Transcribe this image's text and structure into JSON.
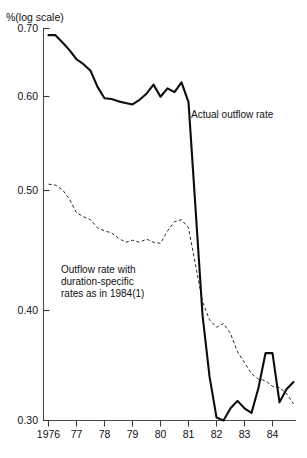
{
  "figure": {
    "yaxis_unit_label": "%(log scale)",
    "background_color": "#ffffff",
    "line_color_solid": "#0d0d0d",
    "line_color_dashed": "#2a2a2a",
    "axis_color": "#4a4a4a"
  },
  "annotations": {
    "actual": "Actual outflow rate",
    "counterfactual_line1": "Outflow rate with",
    "counterfactual_line2": "duration-specific",
    "counterfactual_line3": "rates as in 1984(1)"
  },
  "ticks": {
    "y": [
      "0.70",
      "0.60",
      "0.50",
      "0.40",
      "0.30"
    ],
    "x": [
      "1976",
      "77",
      "78",
      "79",
      "80",
      "81",
      "82",
      "83",
      "84"
    ]
  },
  "chart_data": {
    "type": "line",
    "title": "",
    "subtitle": "",
    "xlabel": "",
    "ylabel": "%(log scale)",
    "yscale": "log",
    "grid": false,
    "legend": "inline-annotations",
    "xlim": [
      1976.0,
      1985.0
    ],
    "ylim": [
      0.3,
      0.7
    ],
    "ytick_values": [
      0.7,
      0.6,
      0.5,
      0.4,
      0.3
    ],
    "ytick_labels": [
      "0.70",
      "0.60",
      "0.50",
      "0.40",
      "0.30"
    ],
    "xtick_values": [
      1976,
      1977,
      1978,
      1979,
      1980,
      1981,
      1982,
      1983,
      1984
    ],
    "xtick_labels": [
      "1976",
      "77",
      "78",
      "79",
      "80",
      "81",
      "82",
      "83",
      "84"
    ],
    "series": [
      {
        "name": "Actual outflow rate",
        "style": "solid",
        "x": [
          1976.0,
          1976.25,
          1976.5,
          1976.75,
          1977.0,
          1977.25,
          1977.5,
          1977.75,
          1978.0,
          1978.25,
          1978.5,
          1978.75,
          1979.0,
          1979.25,
          1979.5,
          1979.75,
          1980.0,
          1980.25,
          1980.5,
          1980.75,
          1981.0,
          1981.25,
          1981.5,
          1981.75,
          1982.0,
          1982.25,
          1982.5,
          1982.75,
          1983.0,
          1983.25,
          1983.5,
          1983.75,
          1984.0,
          1984.25,
          1984.5,
          1984.75
        ],
        "values": [
          0.69,
          0.69,
          0.679,
          0.668,
          0.655,
          0.648,
          0.639,
          0.617,
          0.602,
          0.601,
          0.598,
          0.596,
          0.594,
          0.6,
          0.608,
          0.62,
          0.604,
          0.615,
          0.61,
          0.623,
          0.597,
          0.475,
          0.377,
          0.33,
          0.302,
          0.3,
          0.308,
          0.313,
          0.308,
          0.305,
          0.322,
          0.347,
          0.347,
          0.312,
          0.321,
          0.326
        ]
      },
      {
        "name": "Outflow rate with duration-specific rates as in 1984(1)",
        "style": "dashed",
        "x": [
          1976.0,
          1976.25,
          1976.5,
          1976.75,
          1977.0,
          1977.25,
          1977.5,
          1977.75,
          1978.0,
          1978.25,
          1978.5,
          1978.75,
          1979.0,
          1979.25,
          1979.5,
          1979.75,
          1980.0,
          1980.25,
          1980.5,
          1980.75,
          1981.0,
          1981.25,
          1981.5,
          1981.75,
          1982.0,
          1982.25,
          1982.5,
          1982.75,
          1983.0,
          1983.25,
          1983.5,
          1983.75,
          1984.0,
          1984.25,
          1984.5,
          1984.75
        ],
        "values": [
          0.5,
          0.499,
          0.494,
          0.484,
          0.47,
          0.466,
          0.463,
          0.455,
          0.452,
          0.45,
          0.445,
          0.441,
          0.443,
          0.441,
          0.444,
          0.441,
          0.44,
          0.452,
          0.461,
          0.463,
          0.455,
          0.42,
          0.388,
          0.373,
          0.367,
          0.37,
          0.362,
          0.348,
          0.34,
          0.332,
          0.328,
          0.327,
          0.323,
          0.322,
          0.318,
          0.311
        ]
      }
    ]
  }
}
